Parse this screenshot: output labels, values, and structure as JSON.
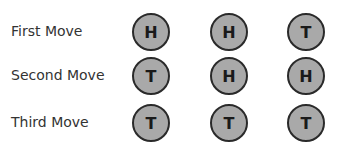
{
  "diagram": {
    "coin_color": "#a9a9a9",
    "coin_border_color": "#2a2a2a",
    "rows": [
      {
        "label": "First Move",
        "coins": [
          "H",
          "H",
          "T"
        ]
      },
      {
        "label": "Second Move",
        "coins": [
          "T",
          "H",
          "H"
        ]
      },
      {
        "label": "Third Move",
        "coins": [
          "T",
          "T",
          "T"
        ]
      }
    ]
  }
}
